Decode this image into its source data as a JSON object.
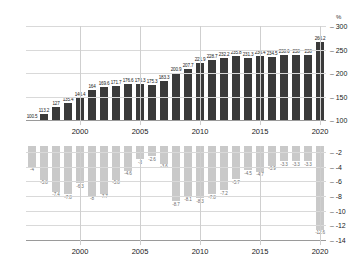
{
  "chart_data": [
    {
      "type": "bar",
      "id": "debt-to-gdp",
      "title": "",
      "xlabel": "",
      "ylabel": "%",
      "unit_label": "%",
      "ylim": [
        100,
        300
      ],
      "yticks": [
        100,
        150,
        200,
        250,
        300
      ],
      "ytick_labels": [
        "100",
        "150",
        "200",
        "250",
        "300"
      ],
      "grid": true,
      "legend": "none",
      "bar_color": "#3a3a3a",
      "categories": [
        "1996",
        "1997",
        "1998",
        "1999",
        "2000",
        "2001",
        "2002",
        "2003",
        "2004",
        "2005",
        "2006",
        "2007",
        "2008",
        "2009",
        "2010",
        "2011",
        "2012",
        "2013",
        "2014",
        "2015",
        "2016",
        "2017",
        "2018",
        "2019",
        "2020"
      ],
      "xtick_labels": [
        "2000",
        "2005",
        "2010",
        "2015",
        "2020"
      ],
      "xtick_categories": [
        "2000",
        "2005",
        "2010",
        "2015",
        "2020"
      ],
      "values": [
        100.5,
        113.2,
        127,
        135.4,
        146.4,
        164,
        169.6,
        171.7,
        176.6,
        176.3,
        175.3,
        183.3,
        200.9,
        207.7,
        221.9,
        228.7,
        232.2,
        235.8,
        231.3,
        236.4,
        234.5,
        238.6,
        238,
        238,
        266.2
      ],
      "value_labels": [
        "100.5",
        "113.2",
        "127",
        "135.4",
        "146.4",
        "164",
        "169.6",
        "171.7",
        "176.6",
        "176.3",
        "175.3",
        "183.3",
        "200.9",
        "207.7",
        "221.9",
        "228.7",
        "232.2",
        "235.8",
        "231.3",
        "236.4",
        "234.5",
        "238.6",
        "238",
        "238",
        "266.2"
      ]
    },
    {
      "type": "bar",
      "id": "budget-balance",
      "title": "",
      "xlabel": "",
      "ylabel": "",
      "ylim": [
        -14,
        -1.2
      ],
      "yticks": [
        -2,
        -4,
        -6,
        -8,
        -10,
        -12,
        -14
      ],
      "ytick_labels": [
        "-2",
        "-4",
        "-6",
        "-8",
        "-10",
        "-12",
        "-14"
      ],
      "grid": true,
      "legend": "none",
      "bar_color": "#c9c9c9",
      "categories": [
        "1996",
        "1997",
        "1998",
        "1999",
        "2000",
        "2001",
        "2002",
        "2003",
        "2004",
        "2005",
        "2006",
        "2007",
        "2008",
        "2009",
        "2010",
        "2011",
        "2012",
        "2013",
        "2014",
        "2015",
        "2016",
        "2017",
        "2018",
        "2019",
        "2020"
      ],
      "xtick_labels": [
        "2000",
        "2005",
        "2010",
        "2015",
        "2020"
      ],
      "xtick_categories": [
        "2000",
        "2005",
        "2010",
        "2015",
        "2020"
      ],
      "values": [
        -4,
        -5.8,
        -7.4,
        -7.8,
        -6.3,
        -8,
        -7.7,
        -5.8,
        -4.6,
        -3,
        -2.6,
        -3.6,
        -8.7,
        -8.1,
        -8.3,
        -7.8,
        -7.2,
        -5.7,
        -4.5,
        -4.7,
        -3.9,
        -3.3,
        -3.3,
        -3.3,
        -12.6
      ],
      "value_labels": [
        "-4",
        "-5.8",
        "-7.4",
        "-7.8",
        "-6.3",
        "-8",
        "-7.7",
        "-5.8",
        "-4.6",
        "-3",
        "-2.6",
        "-3.6",
        "-8.7",
        "-8.1",
        "-8.3",
        "-7.8",
        "-7.2",
        "-5.7",
        "-4.5",
        "-4.7",
        "-3.9",
        "-3.3",
        "-3.3",
        "-3.3",
        "-12.6"
      ]
    }
  ]
}
